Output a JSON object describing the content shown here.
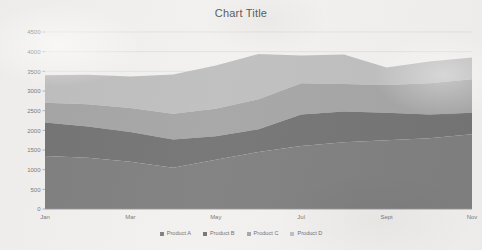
{
  "chart_data": {
    "type": "area",
    "stacked": true,
    "title": "Chart Title",
    "xlabel": "",
    "ylabel": "",
    "ylim": [
      0,
      4500
    ],
    "ytick_step": 500,
    "yticks": [
      "0",
      "500",
      "1000",
      "1500",
      "2000",
      "2500",
      "3000",
      "3500",
      "4000",
      "4500"
    ],
    "grid": true,
    "grid_axis": "y",
    "legend_position": "bottom",
    "categories": [
      "Jan",
      "Feb",
      "Mar",
      "Apr",
      "May",
      "Jun",
      "Jul",
      "Aug",
      "Sept",
      "Oct",
      "Nov"
    ],
    "xtick_labels_shown": [
      "Jan",
      "Mar",
      "May",
      "Jul",
      "Sept",
      "Nov"
    ],
    "series": [
      {
        "name": "Product A",
        "color": "#808080",
        "values": [
          1350,
          1300,
          1200,
          1050,
          1250,
          1450,
          1600,
          1700,
          1750,
          1800,
          1900
        ]
      },
      {
        "name": "Product B",
        "color": "#757575",
        "values": [
          850,
          800,
          760,
          720,
          600,
          580,
          800,
          780,
          700,
          600,
          550
        ]
      },
      {
        "name": "Product C",
        "color": "#a6a6a6",
        "values": [
          500,
          560,
          610,
          650,
          700,
          760,
          800,
          700,
          700,
          800,
          850
        ]
      },
      {
        "name": "Product D",
        "color": "#bfbfbf",
        "values": [
          700,
          750,
          800,
          1000,
          1100,
          1150,
          700,
          750,
          450,
          550,
          550
        ]
      }
    ]
  }
}
